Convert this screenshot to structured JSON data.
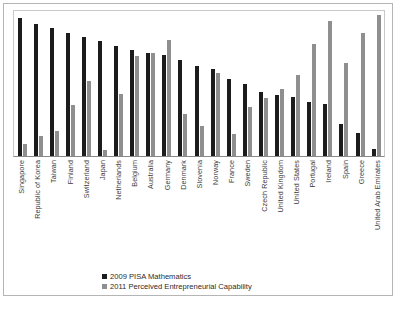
{
  "chart_data": {
    "type": "bar",
    "title": "",
    "subtitle": "",
    "xlabel": "",
    "ylabel": "",
    "grid": false,
    "legend_position": "bottom-center",
    "ylim": [
      0,
      100
    ],
    "categories": [
      "Singapore",
      "Republic of Korea",
      "Taiwan",
      "Finland",
      "Switzerland",
      "Japan",
      "Netherlands",
      "Belgium",
      "Australia",
      "Germany",
      "Denmark",
      "Slovenia",
      "Norway",
      "France",
      "Sweden",
      "Czech Republic",
      "United Kingdom",
      "United States",
      "Portugal",
      "Ireland",
      "Spain",
      "Greece",
      "United Arab Emirates"
    ],
    "series": [
      {
        "name": "2009 PISA Mathematics",
        "color": "#1c1c1c",
        "values": [
          95,
          91,
          88,
          85,
          82,
          79,
          76,
          73,
          71,
          70,
          66,
          62,
          60,
          53,
          50,
          44,
          42,
          41,
          37,
          36,
          22,
          16,
          5
        ]
      },
      {
        "name": "2011 Perceived Entrepreneurial Capability",
        "color": "#8f8f8f",
        "values": [
          8,
          14,
          17,
          35,
          52,
          4,
          43,
          69,
          71,
          80,
          29,
          21,
          57,
          15,
          34,
          40,
          46,
          56,
          77,
          93,
          64,
          85,
          97
        ]
      }
    ]
  },
  "legend": {
    "items": [
      {
        "label": "2009 PISA Mathematics",
        "color": "#1c1c1c"
      },
      {
        "label": "2011 Perceived Entrepreneurial Capability",
        "color": "#8f8f8f"
      }
    ]
  }
}
